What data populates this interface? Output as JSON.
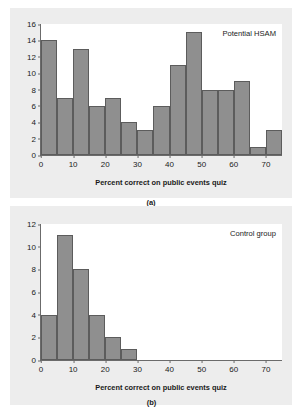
{
  "chart_data": [
    {
      "type": "bar",
      "panel": "a",
      "panel_caption": "(a)",
      "title": "",
      "series_label": "Potential HSAM",
      "xlabel": "Percent correct on public events quiz",
      "ylabel": "Number of individuals quizzed",
      "bin_width": 5,
      "xlim": [
        0,
        75
      ],
      "ylim": [
        0,
        16
      ],
      "xticks": [
        0,
        10,
        20,
        30,
        40,
        50,
        60,
        70
      ],
      "yticks": [
        0,
        2,
        4,
        6,
        8,
        10,
        12,
        14,
        16
      ],
      "grid": false,
      "bin_starts": [
        0,
        5,
        10,
        15,
        20,
        25,
        30,
        35,
        40,
        45,
        50,
        55,
        60,
        65,
        70
      ],
      "categories": [
        "0-5",
        "5-10",
        "10-15",
        "15-20",
        "20-25",
        "25-30",
        "30-35",
        "35-40",
        "40-45",
        "45-50",
        "50-55",
        "55-60",
        "60-65",
        "65-70",
        "70-75"
      ],
      "values": [
        14,
        7,
        13,
        6,
        7,
        4,
        3,
        6,
        11,
        15,
        8,
        8,
        9,
        1,
        3
      ]
    },
    {
      "type": "bar",
      "panel": "b",
      "panel_caption": "(b)",
      "title": "",
      "series_label": "Control group",
      "xlabel": "Percent correct on public events quiz",
      "ylabel": "Number of individuals quizzed",
      "bin_width": 5,
      "xlim": [
        0,
        75
      ],
      "ylim": [
        0,
        12
      ],
      "xticks": [
        0,
        10,
        20,
        30,
        40,
        50,
        60,
        70
      ],
      "yticks": [
        0,
        2,
        4,
        6,
        8,
        10,
        12
      ],
      "grid": false,
      "bin_starts": [
        0,
        5,
        10,
        15,
        20,
        25
      ],
      "categories": [
        "0-5",
        "5-10",
        "10-15",
        "15-20",
        "20-25",
        "25-30"
      ],
      "values": [
        4,
        11,
        8,
        4,
        2,
        1
      ]
    }
  ],
  "colors": {
    "bar_fill": "#8f8f8f",
    "bar_stroke": "#5c5c5c",
    "panel_background": "#ededed",
    "plot_background": "#ffffff",
    "axis": "#6b6b6b",
    "text": "#1a1a1a"
  }
}
